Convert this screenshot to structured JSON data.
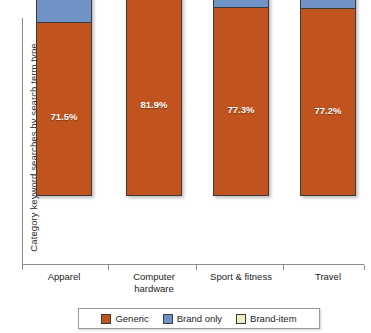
{
  "chart_data": {
    "type": "bar",
    "subtype": "stacked-bar-100-percent",
    "title": "",
    "xlabel": "",
    "ylabel": "Category keyword searches by search term type",
    "ylim": [
      0,
      100
    ],
    "grid": false,
    "legend_position": "bottom",
    "categories": [
      "Apparel",
      "Computer hardware",
      "Sport & fitness",
      "Travel"
    ],
    "category_lines": [
      [
        "Apparel"
      ],
      [
        "Computer",
        "hardware"
      ],
      [
        "Sport & fitness"
      ],
      [
        "Travel"
      ]
    ],
    "series": [
      {
        "name": "Generic",
        "color": "#c1531f",
        "values": [
          71.5,
          81.9,
          77.3,
          77.2
        ],
        "labels": [
          "71.5%",
          "81.9%",
          "77.3%",
          "77.2%"
        ],
        "label_position": "inside"
      },
      {
        "name": "Brand only",
        "color": "#6f93c4",
        "values": [
          27.5,
          14.3,
          22.4,
          21.2
        ],
        "labels": [
          "27.5%",
          "14.3%",
          "22.4%",
          "21.2%"
        ],
        "label_position": "inside"
      },
      {
        "name": "Brand-item",
        "color": "#eeeec0",
        "values": [
          1.0,
          3.8,
          0.3,
          1.6
        ],
        "labels": [
          "1.0%",
          "3.8%",
          "0.3%",
          "1.6%"
        ],
        "label_position": "above-bar"
      }
    ]
  },
  "axis": {
    "y_title": "Category keyword searches by search term type"
  },
  "bars": [
    {
      "category": "Apparel",
      "category_lines": [
        "Apparel"
      ],
      "top_label": "1.0%",
      "generic_label": "71.5%",
      "brand_label": "27.5%",
      "generic_value": 71.5,
      "brand_value": 27.5,
      "item_value": 1.0
    },
    {
      "category": "Computer hardware",
      "category_lines": [
        "Computer",
        "hardware"
      ],
      "top_label": "3.8%",
      "generic_label": "81.9%",
      "brand_label": "14.3%",
      "generic_value": 81.9,
      "brand_value": 14.3,
      "item_value": 3.8
    },
    {
      "category": "Sport & fitness",
      "category_lines": [
        "Sport & fitness"
      ],
      "top_label": "0.3%",
      "generic_label": "77.3%",
      "brand_label": "22.4%",
      "generic_value": 77.3,
      "brand_value": 22.4,
      "item_value": 0.3
    },
    {
      "category": "Travel",
      "category_lines": [
        "Travel"
      ],
      "top_label": "1.6%",
      "generic_label": "77.2%",
      "brand_label": "21.2%",
      "generic_value": 77.2,
      "brand_value": 21.2,
      "item_value": 1.6
    }
  ],
  "legend": {
    "items": [
      {
        "label": "Generic",
        "color": "#c1531f"
      },
      {
        "label": "Brand only",
        "color": "#6f93c4"
      },
      {
        "label": "Brand-item",
        "color": "#eeeec0"
      }
    ]
  }
}
